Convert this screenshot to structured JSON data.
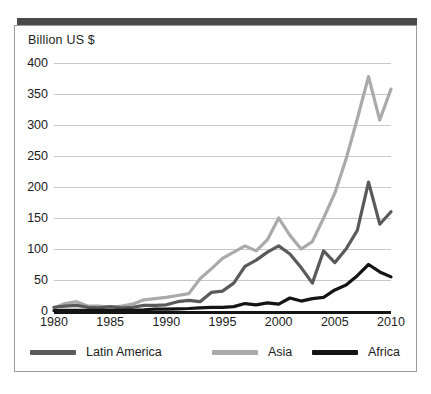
{
  "chart_data": {
    "type": "line",
    "title": "",
    "subtitle": "",
    "ylabel": "Billion US $",
    "xlabel": "",
    "ylim": [
      0,
      400
    ],
    "xlim": [
      1980,
      2010
    ],
    "grid": true,
    "legend_position": "bottom",
    "y_ticks": [
      400,
      350,
      300,
      250,
      200,
      150,
      100,
      50,
      0
    ],
    "x_ticks": [
      1980,
      1985,
      1990,
      1995,
      2000,
      2005,
      2010
    ],
    "x": [
      1980,
      1981,
      1982,
      1983,
      1984,
      1985,
      1986,
      1987,
      1988,
      1989,
      1990,
      1991,
      1992,
      1993,
      1994,
      1995,
      1996,
      1997,
      1998,
      1999,
      2000,
      2001,
      2002,
      2003,
      2004,
      2005,
      2006,
      2007,
      2008,
      2009,
      2010
    ],
    "series": [
      {
        "name": "Latin America",
        "color": "#5a5a5a",
        "values": [
          6,
          8,
          9,
          6,
          5,
          7,
          5,
          6,
          9,
          9,
          10,
          15,
          17,
          15,
          30,
          32,
          45,
          72,
          82,
          95,
          105,
          92,
          70,
          45,
          97,
          78,
          100,
          130,
          208,
          140,
          160
        ]
      },
      {
        "name": "Asia",
        "color": "#aaaaaa",
        "values": [
          5,
          12,
          15,
          8,
          8,
          6,
          8,
          11,
          18,
          20,
          22,
          25,
          28,
          52,
          68,
          85,
          95,
          105,
          97,
          115,
          150,
          122,
          100,
          112,
          150,
          190,
          245,
          310,
          378,
          308,
          358
        ]
      },
      {
        "name": "Africa",
        "color": "#141414",
        "values": [
          0.5,
          1,
          1,
          1,
          1,
          1,
          1,
          1.5,
          2,
          3,
          3,
          3.5,
          4,
          5,
          6,
          6,
          7,
          12,
          10,
          13,
          11,
          21,
          16,
          20,
          22,
          34,
          42,
          57,
          75,
          63,
          55
        ]
      }
    ]
  },
  "legend": {
    "items": [
      {
        "label": "Latin America",
        "color": "#5a5a5a"
      },
      {
        "label": "Asia",
        "color": "#aaaaaa"
      },
      {
        "label": "Africa",
        "color": "#141414"
      }
    ]
  },
  "axis": {
    "y_title": "Billion US $"
  }
}
